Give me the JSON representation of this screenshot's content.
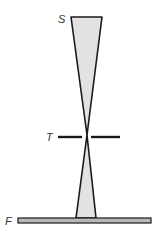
{
  "labels": {
    "source": "S",
    "target": "T",
    "film": "F"
  },
  "colors": {
    "beam_fill": "#e2e2e2",
    "outline": "#1a1a1a",
    "plate_fill": "#b8b8b8",
    "text": "#333333"
  }
}
